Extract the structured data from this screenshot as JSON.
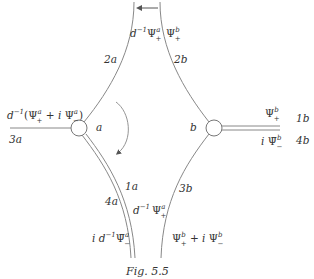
{
  "figure": {
    "caption": "Fig. 5.5",
    "colors": {
      "line": "#777777",
      "text": "#333333",
      "background": "#ffffff"
    }
  },
  "vertices": [
    {
      "id": "a",
      "label": "a",
      "cx": 79,
      "cy": 128,
      "r": 8
    },
    {
      "id": "b",
      "label": "b",
      "cx": 214,
      "cy": 128,
      "r": 8
    }
  ],
  "edges": {
    "top_left": {
      "name": "2a",
      "field": "d⁻¹ Ψₐ₊",
      "main": "d",
      "sup": "−1",
      "psi": "Ψ",
      "psi_sup": "a",
      "psi_sub": "+"
    },
    "top_right": {
      "name": "2b",
      "psi": "Ψ",
      "psi_sup": "b",
      "psi_sub": "+"
    },
    "left": {
      "name": "3a",
      "pre": "d",
      "pre_sup": "−1",
      "open": "(",
      "psi1": "Ψ",
      "psi1_sup": "a",
      "psi1_sub": "+",
      "plus": " + i ",
      "psi2": "Ψ",
      "psi2_sup": "a",
      "psi2_sub": "−",
      "close": ")"
    },
    "right_upper": {
      "name": "1b",
      "psi": "Ψ",
      "psi_sup": "b",
      "psi_sub": "+"
    },
    "right_lower": {
      "name": "4b",
      "pre": "i ",
      "psi": "Ψ̄",
      "psi_sup": "b",
      "psi_sub": "−"
    },
    "bottom_left_outer": {
      "name": "4a",
      "pre": "i d",
      "pre_sup": "−1",
      "psi": "Ψ̄",
      "psi_sup": "a",
      "psi_sub": "−"
    },
    "bottom_left_inner": {
      "name": "1a",
      "pre": "d",
      "pre_sup": "−1",
      "psi": "Ψ",
      "psi_sup": "a",
      "psi_sub": "+"
    },
    "bottom_right": {
      "name": "3b",
      "psi1": "Ψ",
      "psi1_sup": "b",
      "psi1_sub": "+",
      "plus": " + i ",
      "psi2": "Ψ",
      "psi2_sup": "b",
      "psi2_sub": "−"
    }
  },
  "annotations": {
    "top_arrow": "leftward arrow at top between boundary curves",
    "rotation_arrow": "clockwise arc arrow near vertex a"
  }
}
